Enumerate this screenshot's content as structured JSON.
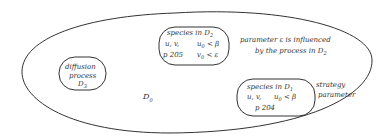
{
  "diagram": {
    "outer_region": {
      "label": "D",
      "label_sub": "0"
    },
    "diffusion_box": {
      "line1": "diffusion",
      "line2": "process",
      "line3": "D",
      "line3_sub": "3"
    },
    "species_d2_box": {
      "line1": "species  in D",
      "line1_sub": "2",
      "line2a": "u, v,",
      "line2b": "u",
      "line2b_sub": "0",
      "line2b_rest": " < β",
      "line3a": "p 205",
      "line3b": "v",
      "line3b_sub": "0",
      "line3b_rest": " < ε"
    },
    "species_d1_box": {
      "line1": "species  in D",
      "line1_sub": "1",
      "line2a": "u, v,",
      "line2b": "u",
      "line2b_sub": "0",
      "line2b_rest": " < β",
      "line3": "p 204"
    },
    "annotation_parameter": {
      "line1": "parameter  ε  is  influenced",
      "line2": "by  the  process  in D",
      "line2_sub": "2"
    },
    "annotation_strategy": {
      "line1": "strategy",
      "line2": "parameter"
    },
    "colors": {
      "stroke": "#333333",
      "background": "#ffffff"
    }
  }
}
